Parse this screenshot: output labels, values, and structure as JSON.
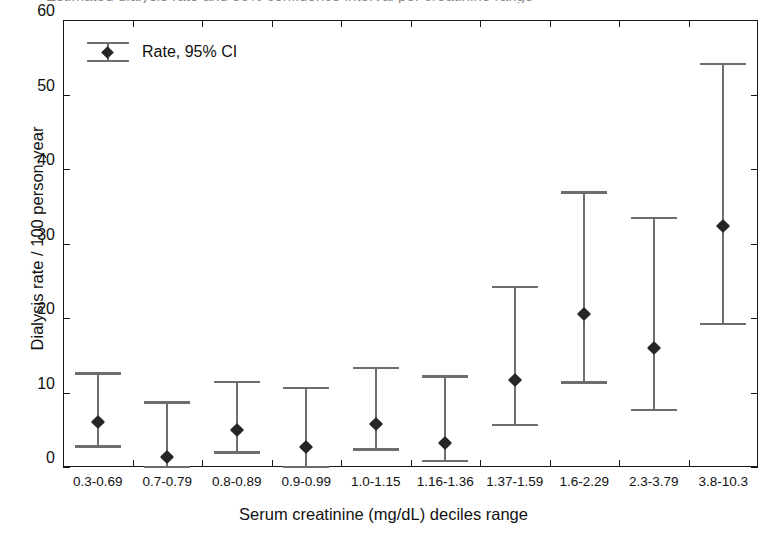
{
  "chart_data": {
    "type": "scatter",
    "title": "Estimated dialysis rate and 95% confidence interval per creatinine range",
    "xlabel": "Serum creatinine (mg/dL) deciles range",
    "ylabel": "Dialysis rate / 100 person-year",
    "ylim": [
      0,
      60
    ],
    "yticks": [
      0,
      10,
      20,
      30,
      40,
      50,
      60
    ],
    "grid": false,
    "legend_position": "top-left",
    "legend": [
      "Rate, 95% CI"
    ],
    "categories": [
      "0.3-0.69",
      "0.7-0.79",
      "0.8-0.89",
      "0.9-0.99",
      "1.0-1.15",
      "1.16-1.36",
      "1.37-1.59",
      "1.6-2.29",
      "2.3-3.79",
      "3.8-10.3"
    ],
    "series": [
      {
        "name": "Rate, 95% CI",
        "values": [
          6.1,
          1.3,
          5.0,
          2.7,
          5.8,
          3.2,
          11.7,
          20.5,
          16.0,
          32.3
        ],
        "ci_lower": [
          2.9,
          0.1,
          2.1,
          0.2,
          2.5,
          0.9,
          5.8,
          11.5,
          7.8,
          19.3
        ],
        "ci_upper": [
          12.7,
          8.8,
          11.6,
          10.8,
          13.4,
          12.3,
          24.3,
          37.0,
          33.6,
          54.2
        ]
      }
    ],
    "colors": {
      "marker": "#262626",
      "errorbar": "#6e6e6e",
      "axis": "#161616",
      "background": "#ffffff"
    }
  }
}
